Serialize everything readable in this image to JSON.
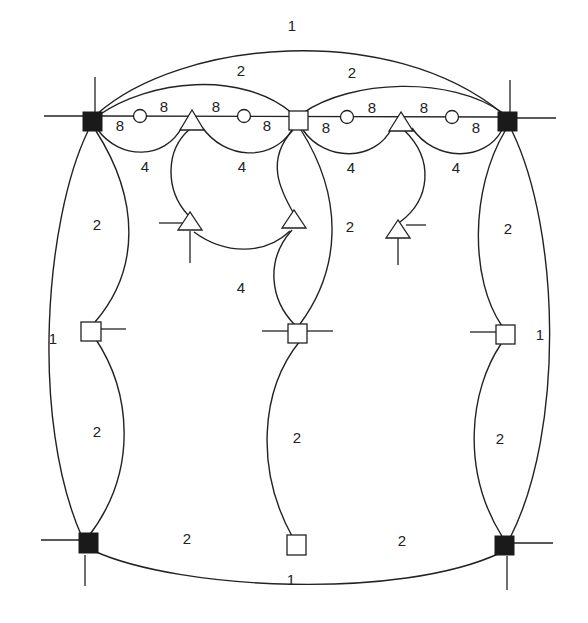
{
  "diagram": {
    "type": "graph-embedding",
    "colors": {
      "line": "#222222",
      "black_node": "#1a1a1a",
      "white_node": "#ffffff",
      "background": "#ffffff"
    },
    "nodes": {
      "black_squares": [
        {
          "id": "TL",
          "x": 92,
          "y": 122
        },
        {
          "id": "TR",
          "x": 508,
          "y": 122
        },
        {
          "id": "BL",
          "x": 88,
          "y": 545
        },
        {
          "id": "BR",
          "x": 505,
          "y": 547
        }
      ],
      "white_squares": [
        {
          "id": "TM",
          "x": 297,
          "y": 122
        },
        {
          "id": "ML",
          "x": 91,
          "y": 330
        },
        {
          "id": "MM",
          "x": 297,
          "y": 332
        },
        {
          "id": "MR",
          "x": 505,
          "y": 335
        },
        {
          "id": "BM",
          "x": 296,
          "y": 545
        }
      ],
      "circles": [
        {
          "id": "C1",
          "x": 140,
          "y": 116
        },
        {
          "id": "C2",
          "x": 244,
          "y": 116
        },
        {
          "id": "C3",
          "x": 347,
          "y": 117
        },
        {
          "id": "C4",
          "x": 452,
          "y": 117
        }
      ],
      "triangles": [
        {
          "id": "T1",
          "x": 192,
          "y": 122
        },
        {
          "id": "T2",
          "x": 402,
          "y": 123
        },
        {
          "id": "T3",
          "x": 190,
          "y": 225
        },
        {
          "id": "T4",
          "x": 294,
          "y": 222
        },
        {
          "id": "T5",
          "x": 398,
          "y": 233
        }
      ]
    },
    "labels": [
      {
        "text": "1",
        "x": 292,
        "y": 31
      },
      {
        "text": "2",
        "x": 241,
        "y": 76
      },
      {
        "text": "2",
        "x": 352,
        "y": 78
      },
      {
        "text": "8",
        "x": 120,
        "y": 131
      },
      {
        "text": "8",
        "x": 164,
        "y": 112
      },
      {
        "text": "8",
        "x": 216,
        "y": 112
      },
      {
        "text": "8",
        "x": 267,
        "y": 131
      },
      {
        "text": "8",
        "x": 326,
        "y": 133
      },
      {
        "text": "8",
        "x": 372,
        "y": 113
      },
      {
        "text": "8",
        "x": 424,
        "y": 113
      },
      {
        "text": "8",
        "x": 476,
        "y": 133
      },
      {
        "text": "4",
        "x": 145,
        "y": 172
      },
      {
        "text": "4",
        "x": 242,
        "y": 172
      },
      {
        "text": "4",
        "x": 351,
        "y": 173
      },
      {
        "text": "4",
        "x": 456,
        "y": 173
      },
      {
        "text": "2",
        "x": 97,
        "y": 230
      },
      {
        "text": "2",
        "x": 350,
        "y": 232
      },
      {
        "text": "2",
        "x": 508,
        "y": 234
      },
      {
        "text": "4",
        "x": 241,
        "y": 293
      },
      {
        "text": "1",
        "x": 53,
        "y": 344
      },
      {
        "text": "1",
        "x": 540,
        "y": 340
      },
      {
        "text": "2",
        "x": 97,
        "y": 437
      },
      {
        "text": "2",
        "x": 297,
        "y": 443
      },
      {
        "text": "2",
        "x": 500,
        "y": 444
      },
      {
        "text": "2",
        "x": 187,
        "y": 544
      },
      {
        "text": "2",
        "x": 402,
        "y": 546
      },
      {
        "text": "1",
        "x": 291,
        "y": 585
      }
    ]
  }
}
